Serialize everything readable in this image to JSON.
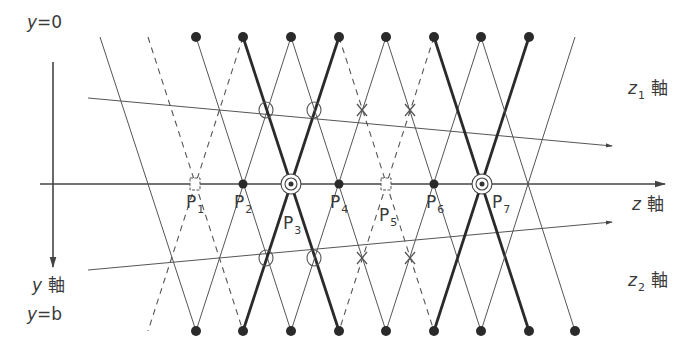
{
  "figure": {
    "labels": {
      "y0": {
        "var": "y",
        "eq": "=0"
      },
      "yb": {
        "var": "y",
        "eq": "=b"
      },
      "y_axis": {
        "var": "y",
        "suffix": "軸"
      },
      "z_axis": {
        "var": "z",
        "suffix": "軸"
      },
      "z1_axis": {
        "var": "z",
        "sub": "1",
        "suffix": "軸"
      },
      "z2_axis": {
        "var": "z",
        "sub": "2",
        "suffix": "軸"
      }
    },
    "points": [
      {
        "name": "P",
        "sub": "1",
        "x": 195,
        "marker": "box"
      },
      {
        "name": "P",
        "sub": "2",
        "x": 243,
        "marker": "dot"
      },
      {
        "name": "P",
        "sub": "3",
        "x": 291,
        "marker": "double-circle"
      },
      {
        "name": "P",
        "sub": "4",
        "x": 339,
        "marker": "dot"
      },
      {
        "name": "P",
        "sub": "5",
        "x": 386,
        "marker": "box"
      },
      {
        "name": "P",
        "sub": "6",
        "x": 434,
        "marker": "dot"
      },
      {
        "name": "P",
        "sub": "7",
        "x": 482,
        "marker": "double-circle"
      }
    ],
    "top_sources_x": [
      196,
      243,
      291,
      339,
      386,
      434,
      481,
      529
    ],
    "bottom_sources_x": [
      196,
      243,
      291,
      339,
      386,
      434,
      481,
      529,
      575
    ],
    "lines": [
      {
        "x1": 100,
        "y1": 37,
        "x2": 196,
        "y2": 331,
        "style": "thin"
      },
      {
        "x1": 148,
        "y1": 37,
        "x2": 243,
        "y2": 331,
        "style": "dashed"
      },
      {
        "x1": 243,
        "y1": 37,
        "x2": 148,
        "y2": 331,
        "style": "dashed"
      },
      {
        "x1": 196,
        "y1": 37,
        "x2": 291,
        "y2": 331,
        "style": "thin"
      },
      {
        "x1": 291,
        "y1": 37,
        "x2": 196,
        "y2": 331,
        "style": "thin"
      },
      {
        "x1": 243,
        "y1": 37,
        "x2": 339,
        "y2": 331,
        "style": "thick"
      },
      {
        "x1": 339,
        "y1": 37,
        "x2": 243,
        "y2": 331,
        "style": "thick"
      },
      {
        "x1": 291,
        "y1": 37,
        "x2": 386,
        "y2": 331,
        "style": "thin"
      },
      {
        "x1": 386,
        "y1": 37,
        "x2": 291,
        "y2": 331,
        "style": "thin"
      },
      {
        "x1": 339,
        "y1": 37,
        "x2": 434,
        "y2": 331,
        "style": "dashed"
      },
      {
        "x1": 434,
        "y1": 37,
        "x2": 339,
        "y2": 331,
        "style": "dashed"
      },
      {
        "x1": 386,
        "y1": 37,
        "x2": 481,
        "y2": 331,
        "style": "thin"
      },
      {
        "x1": 481,
        "y1": 37,
        "x2": 386,
        "y2": 331,
        "style": "thin"
      },
      {
        "x1": 434,
        "y1": 37,
        "x2": 529,
        "y2": 331,
        "style": "thick"
      },
      {
        "x1": 529,
        "y1": 37,
        "x2": 434,
        "y2": 331,
        "style": "thick"
      },
      {
        "x1": 481,
        "y1": 37,
        "x2": 575,
        "y2": 331,
        "style": "thin"
      },
      {
        "x1": 575,
        "y1": 37,
        "x2": 481,
        "y2": 331,
        "style": "thin"
      }
    ],
    "circle_marks": [
      {
        "x": 266,
        "y": 110
      },
      {
        "x": 314,
        "y": 110
      },
      {
        "x": 266,
        "y": 258
      },
      {
        "x": 314,
        "y": 258
      }
    ],
    "cross_marks": [
      {
        "x": 362,
        "y": 110
      },
      {
        "x": 410,
        "y": 110
      },
      {
        "x": 362,
        "y": 258
      },
      {
        "x": 410,
        "y": 258
      }
    ],
    "axes": {
      "z": {
        "x1": 40,
        "y1": 184,
        "x2": 665,
        "y2": 184
      },
      "z1": {
        "x1": 88,
        "y1": 98,
        "x2": 612,
        "y2": 146
      },
      "z2": {
        "x1": 88,
        "y1": 270,
        "x2": 612,
        "y2": 222
      },
      "y": {
        "x1": 53,
        "y1": 62,
        "x2": 53,
        "y2": 267
      }
    },
    "colors": {
      "ink": "#333333",
      "thin": "#555555"
    }
  }
}
